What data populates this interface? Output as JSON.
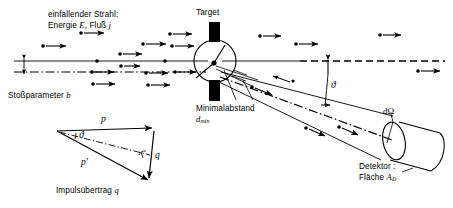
{
  "figure": {
    "domain_label": "rutherford-scattering-diagram",
    "background": "#ffffff",
    "ink": "#000000"
  },
  "labels": {
    "beam_line1": "einfallender Strahl:",
    "beam_line2_prefix": "Energie ",
    "beam_energy_symbol": "E",
    "beam_line2_mid": ", Fluß ",
    "beam_flux_symbol": "j",
    "impact_parameter_text": "Stoßparameter ",
    "impact_parameter_symbol": "b",
    "target": "Target",
    "min_distance_line1": "Minimalabstand",
    "min_distance_symbol": "d",
    "min_distance_subscript": "min",
    "solid_angle": "dΩ",
    "detector_line1": "Detektor :",
    "detector_line2_prefix": "Fläche ",
    "detector_area_symbol": "A",
    "detector_area_subscript": "D",
    "scattering_angle_symbol": "ϑ"
  },
  "momentum_triangle": {
    "caption_prefix": "Impulsübertrag ",
    "caption_symbol": "q",
    "vector_p": "p",
    "vector_p_prime": "p'",
    "vector_q": "q",
    "angle_symbol": "ϑ"
  }
}
